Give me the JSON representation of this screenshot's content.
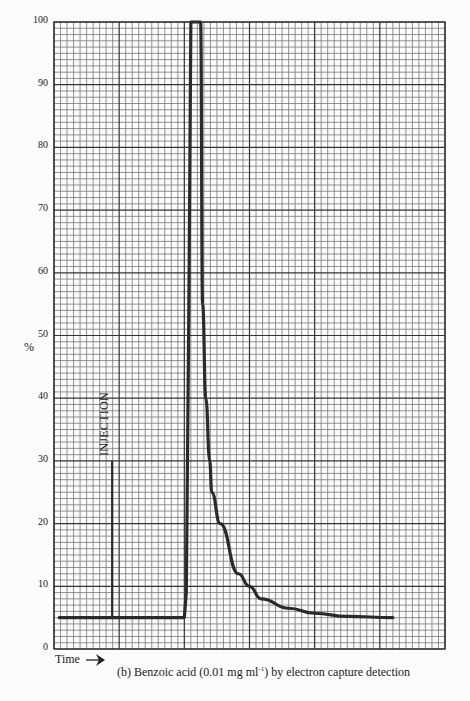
{
  "chart_data": {
    "type": "line",
    "title": "(b) Benzoic acid (0.01 mg ml-1) by electron capture detection",
    "caption": {
      "prefix": "(b) Benzoic acid (0.01 mg ml",
      "superscript": "-1",
      "suffix": ") by electron capture detection"
    },
    "xlabel": "Time",
    "ylabel": "%",
    "ylim": [
      0,
      100
    ],
    "yticks": [
      0,
      10,
      20,
      30,
      40,
      50,
      60,
      70,
      80,
      90,
      100
    ],
    "grid": true,
    "annotations": [
      {
        "text": "INJECTION",
        "x_major": 1.0,
        "y": 30,
        "type": "vertical-marker"
      }
    ],
    "series": [
      {
        "name": "detector response",
        "description": "baseline at 5%, sharp rise to full-scale 100% (off-scale), then exponential-like decay back to 5%",
        "x_major_units": [
          0.08,
          0.9,
          2.0,
          2.03,
          2.07,
          2.1,
          2.25,
          2.28,
          2.33,
          2.39,
          2.42,
          2.55,
          2.83,
          3.0,
          3.18,
          3.6,
          4.0,
          4.5,
          5.2
        ],
        "values": [
          5,
          5,
          5,
          9,
          55,
          100,
          100,
          55,
          40,
          30,
          25,
          20,
          12,
          10,
          8,
          6.5,
          5.7,
          5.2,
          5
        ]
      }
    ]
  },
  "labels": {
    "y_axis": "%",
    "time": "Time",
    "injection": "INJECTION"
  }
}
